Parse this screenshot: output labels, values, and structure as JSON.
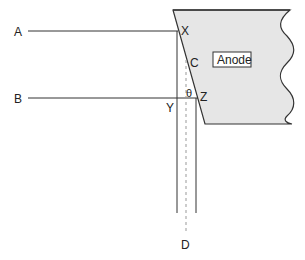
{
  "diagram": {
    "type": "anode geometry (X-ray tube line focus)",
    "colors": {
      "anode_fill": "#e6e6e6",
      "stroke": "#333333",
      "dashed": "#9a9a9a"
    },
    "labels": {
      "A": "A",
      "B": "B",
      "X": "X",
      "C": "C",
      "Y": "Y",
      "Z": "Z",
      "theta": "θ",
      "D": "D",
      "anode": "Anode"
    }
  }
}
